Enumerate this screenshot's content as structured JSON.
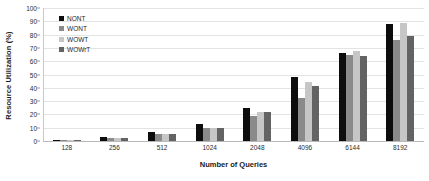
{
  "chart_data": {
    "type": "bar",
    "title": "",
    "xlabel": "Number of Queries",
    "ylabel": "Resource Utilization (%)",
    "categories": [
      "128",
      "256",
      "512",
      "1024",
      "2048",
      "4096",
      "6144",
      "8192"
    ],
    "series": [
      {
        "name": "NONT",
        "color": "#0d0d0d",
        "values": [
          1,
          3,
          7,
          13,
          25,
          48,
          66,
          88
        ]
      },
      {
        "name": "WONT",
        "color": "#8a8a8a",
        "values": [
          1,
          2,
          5,
          10,
          19,
          32,
          65,
          76
        ]
      },
      {
        "name": "WOWT",
        "color": "#c6c6c6",
        "values": [
          1,
          2,
          5,
          10,
          22,
          44,
          68,
          89
        ]
      },
      {
        "name": "WOWrT",
        "color": "#636363",
        "values": [
          1,
          2,
          5,
          10,
          22,
          41,
          64,
          79
        ]
      }
    ],
    "ylim": [
      0,
      100
    ],
    "yticks": [
      0,
      10,
      20,
      30,
      40,
      50,
      60,
      70,
      80,
      90,
      100
    ],
    "grid": true,
    "legend_position": "top-left"
  }
}
